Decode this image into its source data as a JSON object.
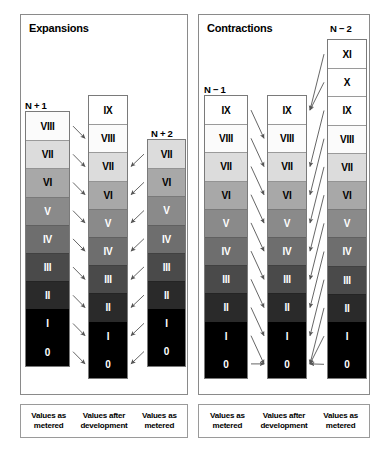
{
  "panels": [
    {
      "id": "expansions",
      "title": "Expansions",
      "legend": [
        "Values as metered",
        "Values after development",
        "Values as metered"
      ],
      "columns": [
        {
          "name": "N+1",
          "label": "N + 1",
          "cells": [
            "VIII",
            "VII",
            "VI",
            "V",
            "IV",
            "III",
            "II",
            "I",
            "0"
          ]
        },
        {
          "name": "developed",
          "label": "",
          "cells": [
            "IX",
            "VIII",
            "VII",
            "VI",
            "V",
            "IV",
            "III",
            "II",
            "I",
            "0"
          ]
        },
        {
          "name": "N+2",
          "label": "N + 2",
          "cells": [
            "VII",
            "VI",
            "V",
            "IV",
            "III",
            "II",
            "I",
            "0"
          ]
        }
      ]
    },
    {
      "id": "contractions",
      "title": "Contractions",
      "legend": [
        "Values as metered",
        "Values after development",
        "Values as metered"
      ],
      "columns": [
        {
          "name": "N-1",
          "label": "N − 1",
          "cells": [
            "IX",
            "VIII",
            "VII",
            "VI",
            "V",
            "IV",
            "III",
            "II",
            "I",
            "0"
          ]
        },
        {
          "name": "developed",
          "label": "",
          "cells": [
            "IX",
            "VIII",
            "VII",
            "VI",
            "V",
            "IV",
            "III",
            "II",
            "I",
            "0"
          ]
        },
        {
          "name": "N-2",
          "label": "N − 2",
          "cells": [
            "XI",
            "X",
            "IX",
            "VIII",
            "VII",
            "VI",
            "V",
            "IV",
            "III",
            "II",
            "I",
            "0"
          ]
        }
      ]
    }
  ],
  "zone_colors": {
    "XI": "#ffffff",
    "X": "#ffffff",
    "IX": "#ffffff",
    "VIII": "#fbfbfb",
    "VII": "#dcdcdc",
    "VI": "#a8a8a8",
    "V": "#8a8a8a",
    "IV": "#6e6e6e",
    "III": "#4a4a4a",
    "II": "#2a2a2a",
    "I": "#000000",
    "0": "#000000"
  },
  "zone_text_colors": {
    "XI": "#000000",
    "X": "#000000",
    "IX": "#000000",
    "VIII": "#000000",
    "VII": "#000000",
    "VI": "#000000",
    "V": "#ffffff",
    "IV": "#ffffff",
    "III": "#ffffff",
    "II": "#ffffff",
    "I": "#ffffff",
    "0": "#ffffff"
  },
  "arrow_color": "#555555",
  "border_color": "#7a7a7a"
}
